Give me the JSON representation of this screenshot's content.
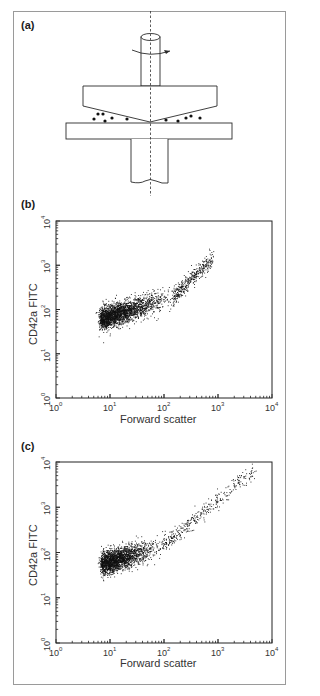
{
  "figure": {
    "panels": [
      {
        "id": "a",
        "label": "(a)"
      },
      {
        "id": "b",
        "label": "(b)"
      },
      {
        "id": "c",
        "label": "(c)"
      }
    ]
  },
  "diagram": {
    "colors": {
      "line": "#2a2a2a",
      "dots": "#111111",
      "axis": "#333333"
    },
    "particles_left": [
      [
        94,
        119
      ],
      [
        98,
        114
      ],
      [
        103,
        114
      ],
      [
        105,
        121
      ],
      [
        112,
        118
      ],
      [
        127,
        119
      ]
    ],
    "particles_right": [
      [
        166,
        120
      ],
      [
        178,
        121
      ],
      [
        186,
        118
      ],
      [
        191,
        116
      ],
      [
        200,
        118
      ]
    ]
  },
  "chart_data": [
    {
      "panel": "(b)",
      "type": "scatter",
      "title": "",
      "xlabel": "Forward scatter",
      "ylabel": "CD42a FITC",
      "xscale": "log",
      "yscale": "log",
      "xlim": [
        1,
        10000
      ],
      "ylim": [
        1,
        10000
      ],
      "x_ticks": [
        "10^0",
        "10^1",
        "10^2",
        "10^3",
        "10^4"
      ],
      "y_ticks": [
        "10^0",
        "10^1",
        "10^2",
        "10^3",
        "10^4"
      ],
      "grid": false,
      "legend": null,
      "point_cloud": {
        "dense_region": {
          "x_range": [
            6.5,
            150
          ],
          "y_center_at_x_min": 60,
          "y_center_at_x_max": 200,
          "y_spread_decades": 0.25
        },
        "sparse_tail": {
          "x_range": [
            150,
            800
          ],
          "y_range": [
            200,
            1500
          ]
        },
        "approx_points": 2600
      },
      "summary_points": [
        {
          "x": 7,
          "y": 55
        },
        {
          "x": 10,
          "y": 65
        },
        {
          "x": 20,
          "y": 80
        },
        {
          "x": 50,
          "y": 110
        },
        {
          "x": 100,
          "y": 160
        },
        {
          "x": 200,
          "y": 260
        },
        {
          "x": 400,
          "y": 500
        },
        {
          "x": 700,
          "y": 1500
        }
      ]
    },
    {
      "panel": "(c)",
      "type": "scatter",
      "title": "",
      "xlabel": "Forward scatter",
      "ylabel": "CD42a FITC",
      "xscale": "log",
      "yscale": "log",
      "xlim": [
        1,
        10000
      ],
      "ylim": [
        1,
        10000
      ],
      "x_ticks": [
        "10^0",
        "10^1",
        "10^2",
        "10^3",
        "10^4"
      ],
      "y_ticks": [
        "10^0",
        "10^1",
        "10^2",
        "10^3",
        "10^4"
      ],
      "grid": false,
      "legend": null,
      "point_cloud": {
        "dense_region": {
          "x_range": [
            7,
            90
          ],
          "y_center_at_x_min": 55,
          "y_center_at_x_max": 140,
          "y_spread_decades": 0.25
        },
        "sparse_tail": {
          "x_range": [
            90,
            4500
          ],
          "y_range": [
            140,
            6500
          ]
        },
        "approx_points": 2400
      },
      "summary_points": [
        {
          "x": 7,
          "y": 50
        },
        {
          "x": 15,
          "y": 70
        },
        {
          "x": 40,
          "y": 100
        },
        {
          "x": 100,
          "y": 170
        },
        {
          "x": 300,
          "y": 400
        },
        {
          "x": 1000,
          "y": 1500
        },
        {
          "x": 2500,
          "y": 4000
        },
        {
          "x": 4500,
          "y": 6000
        }
      ]
    }
  ],
  "axes_text": {
    "b": {
      "xlabel": "Forward scatter",
      "ylabel": "CD42a FITC"
    },
    "c": {
      "xlabel": "Forward scatter",
      "ylabel": "CD42a FITC"
    }
  },
  "tick_base": "10",
  "tick_exponents": [
    "0",
    "1",
    "2",
    "3",
    "4"
  ]
}
